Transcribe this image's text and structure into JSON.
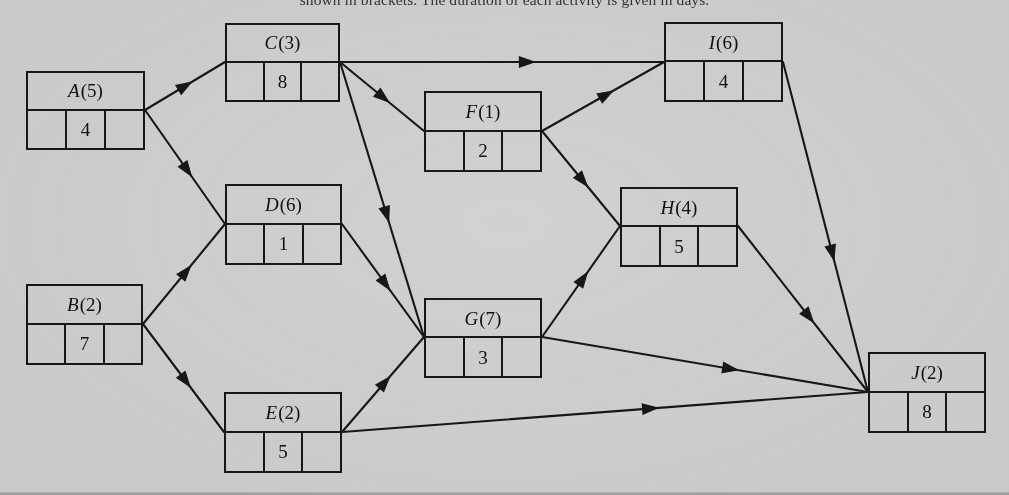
{
  "header": {
    "caption_fragment": "shown in brackets. The duration of each activity is given in days."
  },
  "diagram": {
    "background_color": "#d4d4d4",
    "line_color": "#171717",
    "nodes": [
      {
        "id": "A",
        "label": "A",
        "duration": "(5)",
        "value": "4",
        "x": 26,
        "y": 71,
        "w": 119,
        "h": 79
      },
      {
        "id": "C",
        "label": "C",
        "duration": "(3)",
        "value": "8",
        "x": 225,
        "y": 23,
        "w": 115,
        "h": 79
      },
      {
        "id": "I",
        "label": "I",
        "duration": "(6)",
        "value": "4",
        "x": 664,
        "y": 22,
        "w": 119,
        "h": 80
      },
      {
        "id": "F",
        "label": "F",
        "duration": "(1)",
        "value": "2",
        "x": 424,
        "y": 91,
        "w": 118,
        "h": 81
      },
      {
        "id": "D",
        "label": "D",
        "duration": "(6)",
        "value": "1",
        "x": 225,
        "y": 184,
        "w": 117,
        "h": 81
      },
      {
        "id": "H",
        "label": "H",
        "duration": "(4)",
        "value": "5",
        "x": 620,
        "y": 187,
        "w": 118,
        "h": 80
      },
      {
        "id": "B",
        "label": "B",
        "duration": "(2)",
        "value": "7",
        "x": 26,
        "y": 284,
        "w": 117,
        "h": 81
      },
      {
        "id": "G",
        "label": "G",
        "duration": "(7)",
        "value": "3",
        "x": 424,
        "y": 298,
        "w": 118,
        "h": 80
      },
      {
        "id": "J",
        "label": "J",
        "duration": "(2)",
        "value": "8",
        "x": 868,
        "y": 352,
        "w": 118,
        "h": 81
      },
      {
        "id": "E",
        "label": "E",
        "duration": "(2)",
        "value": "5",
        "x": 224,
        "y": 392,
        "w": 118,
        "h": 81
      }
    ],
    "edges": [
      {
        "from": "A",
        "to": "C",
        "x1": 145,
        "y1": 110,
        "x2": 225,
        "y2": 62
      },
      {
        "from": "A",
        "to": "D",
        "x1": 145,
        "y1": 110,
        "x2": 225,
        "y2": 224
      },
      {
        "from": "B",
        "to": "D",
        "x1": 143,
        "y1": 324,
        "x2": 225,
        "y2": 224
      },
      {
        "from": "B",
        "to": "E",
        "x1": 143,
        "y1": 324,
        "x2": 224,
        "y2": 432
      },
      {
        "from": "C",
        "to": "I",
        "x1": 340,
        "y1": 62,
        "x2": 664,
        "y2": 62
      },
      {
        "from": "C",
        "to": "F",
        "x1": 340,
        "y1": 62,
        "x2": 424,
        "y2": 131
      },
      {
        "from": "C",
        "to": "G",
        "x1": 340,
        "y1": 62,
        "x2": 424,
        "y2": 337
      },
      {
        "from": "D",
        "to": "G",
        "x1": 342,
        "y1": 224,
        "x2": 424,
        "y2": 337
      },
      {
        "from": "E",
        "to": "G",
        "x1": 342,
        "y1": 432,
        "x2": 424,
        "y2": 337
      },
      {
        "from": "E",
        "to": "J",
        "x1": 342,
        "y1": 432,
        "x2": 868,
        "y2": 392
      },
      {
        "from": "F",
        "to": "I",
        "x1": 542,
        "y1": 131,
        "x2": 664,
        "y2": 62
      },
      {
        "from": "F",
        "to": "H",
        "x1": 542,
        "y1": 131,
        "x2": 620,
        "y2": 226
      },
      {
        "from": "G",
        "to": "H",
        "x1": 542,
        "y1": 337,
        "x2": 620,
        "y2": 226
      },
      {
        "from": "G",
        "to": "J",
        "x1": 542,
        "y1": 337,
        "x2": 868,
        "y2": 392
      },
      {
        "from": "H",
        "to": "J",
        "x1": 738,
        "y1": 226,
        "x2": 868,
        "y2": 392
      },
      {
        "from": "I",
        "to": "J",
        "x1": 783,
        "y1": 62,
        "x2": 868,
        "y2": 392
      }
    ]
  }
}
